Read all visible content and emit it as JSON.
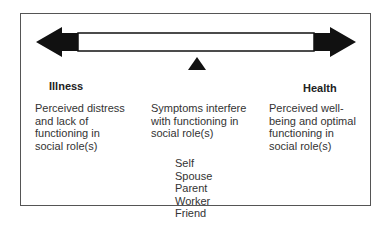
{
  "diagram": {
    "type": "continuum",
    "left_label": "Illness",
    "right_label": "Health",
    "left_description": [
      "Perceived distress",
      "and lack of",
      "functioning in",
      "social role(s)"
    ],
    "middle_description": [
      "Symptoms interfere",
      "with functioning in",
      "social role(s)"
    ],
    "right_description": [
      "Perceived well-",
      "being and optimal",
      "functioning in",
      "social role(s)"
    ],
    "roles": [
      "Self",
      "Spouse",
      "Parent",
      "Worker",
      "Friend"
    ],
    "colors": {
      "arrow": "#111111",
      "border": "#555555",
      "text": "#333333"
    }
  }
}
